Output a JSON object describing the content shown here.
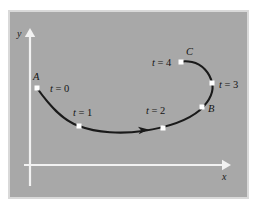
{
  "figure": {
    "title": "Parametrized curve with time markers",
    "background_color": "#ffffff",
    "panel": {
      "fill_color": "#a8a8a8",
      "border_color": "#d9d9d9",
      "x": 8,
      "y": 10,
      "width": 241,
      "height": 189
    },
    "axes": {
      "color": "#f2f2f2",
      "x_axis": {
        "label": "x",
        "label_x": 222,
        "label_y": 180,
        "start_x": 24,
        "start_y": 165,
        "end_x": 231,
        "end_y": 165
      },
      "y_axis": {
        "label": "y",
        "label_x": 17,
        "label_y": 37,
        "start_x": 30,
        "start_y": 186,
        "end_x": 30,
        "end_y": 28
      }
    },
    "curve": {
      "color": "#1a1a1a",
      "stroke_width": 2.1,
      "path": "M 37,88 C 49,105 62,120 79,126 C 97,133 122,134 143,131 C 163,128 186,122 200,110 C 211,100 214,90 212,83 C 210,73 202,64 192,62 C 187,61 183,61 181,62",
      "direction_arrow": {
        "x": 143,
        "y": 130,
        "angle_deg": -6,
        "size": 9
      }
    },
    "markers": {
      "fill_color": "#ffffff",
      "size": 5,
      "points": [
        {
          "name": "t0",
          "t_label": "t = 0",
          "point_label": "A",
          "x": 37,
          "y": 88,
          "t_label_x": 50,
          "t_label_y": 92,
          "point_label_x": 33,
          "point_label_y": 80
        },
        {
          "name": "t1",
          "t_label": "t = 1",
          "point_label": "",
          "x": 79,
          "y": 126,
          "t_label_x": 73,
          "t_label_y": 116,
          "point_label_x": 0,
          "point_label_y": 0
        },
        {
          "name": "t2",
          "t_label": "t = 2",
          "point_label": "",
          "x": 163,
          "y": 128,
          "t_label_x": 146,
          "t_label_y": 114,
          "point_label_x": 0,
          "point_label_y": 0
        },
        {
          "name": "t3",
          "t_label": "t = 3",
          "point_label": "B",
          "x": 212,
          "y": 83,
          "t_label_x": 219,
          "t_label_y": 88,
          "point_label_x": 208,
          "point_label_y": 112
        },
        {
          "name": "t4",
          "t_label": "t = 4",
          "point_label": "C",
          "x": 181,
          "y": 62,
          "t_label_x": 152,
          "t_label_y": 66,
          "point_label_x": 186,
          "point_label_y": 55
        }
      ],
      "b_point": {
        "name": "B",
        "label": "B",
        "x": 202,
        "y": 107
      }
    }
  },
  "chart_data": {
    "type": "line",
    "title": "Parametrized curve with time markers",
    "xlabel": "x",
    "ylabel": "y",
    "grid": false,
    "legend": null,
    "series": [
      {
        "name": "r(t)",
        "parameter": "t",
        "points": [
          {
            "t": 0,
            "label": "A",
            "x": 37,
            "y": 88
          },
          {
            "t": 1,
            "label": "",
            "x": 79,
            "y": 126
          },
          {
            "t": 2,
            "label": "",
            "x": 163,
            "y": 128
          },
          {
            "t": 3,
            "label": "B",
            "x": 212,
            "y": 83
          },
          {
            "t": 4,
            "label": "C",
            "x": 181,
            "y": 62
          }
        ]
      }
    ],
    "annotations": [
      {
        "text": "t = 0",
        "x": 50,
        "y": 92
      },
      {
        "text": "t = 1",
        "x": 73,
        "y": 116
      },
      {
        "text": "t = 2",
        "x": 146,
        "y": 114
      },
      {
        "text": "t = 3",
        "x": 219,
        "y": 88
      },
      {
        "text": "t = 4",
        "x": 152,
        "y": 66
      },
      {
        "text": "A",
        "x": 33,
        "y": 80
      },
      {
        "text": "B",
        "x": 208,
        "y": 112
      },
      {
        "text": "C",
        "x": 186,
        "y": 55
      }
    ]
  }
}
